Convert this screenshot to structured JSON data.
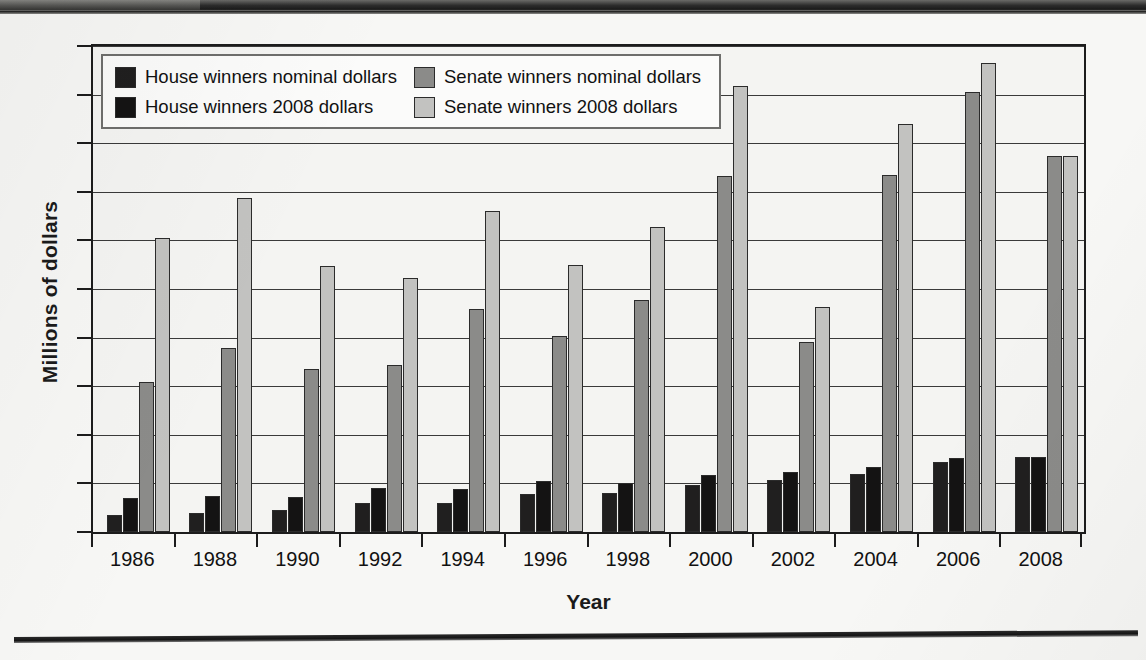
{
  "chart_data": {
    "type": "bar",
    "title": "",
    "xlabel": "Year",
    "ylabel": "Millions of dollars",
    "ylim": [
      0,
      10
    ],
    "ytick_labels": [
      "10",
      "9",
      "8",
      "7",
      "6",
      "5",
      "4",
      "3",
      "2",
      "1",
      "0"
    ],
    "grid": true,
    "legend_position": "top-left inside plot",
    "categories": [
      "1986",
      "1988",
      "1990",
      "1992",
      "1994",
      "1996",
      "1998",
      "2000",
      "2002",
      "2004",
      "2006",
      "2008"
    ],
    "series": [
      {
        "name": "House winners nominal dollars",
        "color": "#201f1f",
        "values": [
          0.35,
          0.4,
          0.45,
          0.59,
          0.6,
          0.78,
          0.8,
          0.97,
          1.08,
          1.2,
          1.45,
          1.55
        ]
      },
      {
        "name": "House winners 2008 dollars",
        "color": "#141313",
        "values": [
          0.7,
          0.74,
          0.73,
          0.9,
          0.88,
          1.04,
          1.01,
          1.17,
          1.23,
          1.33,
          1.52,
          1.55
        ]
      },
      {
        "name": "Senate winners nominal dollars",
        "color": "#8b8b89",
        "values": [
          3.08,
          3.78,
          3.35,
          3.43,
          4.58,
          4.03,
          4.78,
          7.33,
          3.9,
          7.35,
          9.05,
          7.74
        ]
      },
      {
        "name": "Senate winners 2008 dollars",
        "color": "#c2c2c0",
        "values": [
          6.05,
          6.87,
          5.48,
          5.23,
          6.6,
          5.49,
          6.28,
          9.17,
          4.64,
          8.4,
          9.65,
          7.74
        ]
      }
    ]
  },
  "legend": {
    "items": [
      {
        "label": "House winners nominal dollars",
        "swatch": "#201f1f"
      },
      {
        "label": "Senate winners nominal dollars",
        "swatch": "#8b8b89"
      },
      {
        "label": "House winners 2008 dollars",
        "swatch": "#141313"
      },
      {
        "label": "Senate winners 2008 dollars",
        "swatch": "#c2c2c0"
      }
    ]
  }
}
